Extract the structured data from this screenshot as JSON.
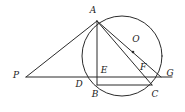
{
  "figure": {
    "stroke_color": "#2b2b2b",
    "label_color": "#1b1b1b",
    "background": "#ffffff",
    "width": 185,
    "height": 112
  },
  "circle": {
    "name": "circle-O",
    "center_label": "O",
    "center_x": 122,
    "center_y": 56,
    "radius": 40,
    "center_dot_x": 133,
    "center_dot_y": 52
  },
  "points": [
    {
      "id": "A",
      "label": "A",
      "x": 97,
      "y": 21,
      "label_x": 93,
      "label_y": 10,
      "on_circle": true
    },
    {
      "id": "P",
      "label": "P",
      "x": 26,
      "y": 77,
      "label_x": 16,
      "label_y": 75,
      "on_circle": false
    },
    {
      "id": "O",
      "label": "O",
      "x": 133,
      "y": 52,
      "label_x": 136,
      "label_y": 39,
      "on_circle": false
    },
    {
      "id": "D",
      "label": "D",
      "x": 84,
      "y": 77,
      "label_x": 79,
      "label_y": 84,
      "on_circle": true
    },
    {
      "id": "E",
      "label": "E",
      "x": 97,
      "y": 77,
      "label_x": 104,
      "label_y": 70,
      "on_circle": false
    },
    {
      "id": "F",
      "label": "F",
      "x": 143,
      "y": 77,
      "label_x": 143,
      "label_y": 67,
      "on_circle": false
    },
    {
      "id": "G",
      "label": "G",
      "x": 161,
      "y": 77,
      "label_x": 170,
      "label_y": 73,
      "on_circle": true
    },
    {
      "id": "B",
      "label": "B",
      "x": 97,
      "y": 85,
      "label_x": 95,
      "label_y": 94,
      "on_circle": true
    },
    {
      "id": "C",
      "label": "C",
      "x": 152,
      "y": 85,
      "label_x": 155,
      "label_y": 94,
      "on_circle": true
    }
  ],
  "segments": [
    {
      "id": "PA",
      "from": "P",
      "to": "A",
      "desc": "line from external point P to A"
    },
    {
      "id": "PG",
      "from": "P",
      "to": "G",
      "desc": "horizontal secant from P through D, E, F to G"
    },
    {
      "id": "AB",
      "from": "A",
      "to": "B",
      "desc": "vertical chord A to B through E"
    },
    {
      "id": "AC",
      "from": "A",
      "to": "C",
      "desc": "chord A to C through F"
    },
    {
      "id": "AG",
      "from": "A",
      "to": "G",
      "desc": "chord A to G passing near center O"
    },
    {
      "id": "BC",
      "from": "B",
      "to": "C",
      "desc": "horizontal chord B to C"
    }
  ]
}
